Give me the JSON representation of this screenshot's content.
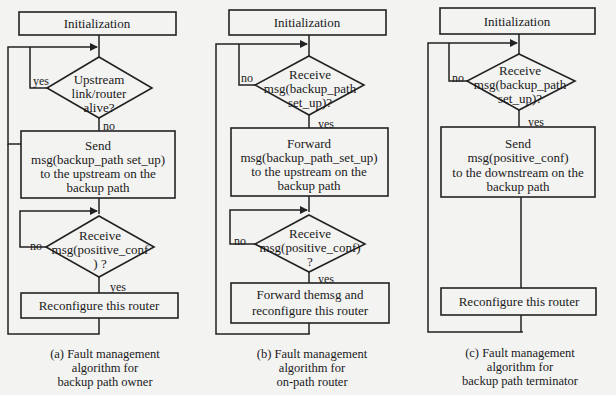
{
  "diagrams": [
    {
      "id": "a",
      "init": "Initialization",
      "decision1": [
        "Upstream",
        "link/router",
        "alive?"
      ],
      "d1_yes": "yes",
      "d1_no": "no",
      "action1": [
        "Send",
        "msg(backup_path set_up)",
        "to the upstream on the",
        "backup path"
      ],
      "decision2": [
        "Receive",
        "msg(positive_conf",
        ") ?"
      ],
      "d2_no": "no",
      "d2_yes": "yes",
      "action2": [
        "Reconfigure this router"
      ],
      "caption": [
        "(a) Fault management",
        "algorithm for",
        "backup path owner"
      ]
    },
    {
      "id": "b",
      "init": "Initialization",
      "decision1": [
        "Receive",
        "msg(backup_path",
        "set_up)?"
      ],
      "d1_no": "no",
      "d1_yes": "yes",
      "action1": [
        "Forward",
        "msg(backup_path_set_up)",
        "to the upstream on the",
        "backup path"
      ],
      "decision2": [
        "Receive",
        "msg(positive_conf)",
        "?"
      ],
      "d2_no": "no",
      "d2_yes": "yes",
      "action2": [
        "Forward themsg and",
        "reconfigure this router"
      ],
      "caption": [
        "(b) Fault management",
        "algorithm for",
        "on-path router"
      ]
    },
    {
      "id": "c",
      "init": "Initialization",
      "decision1": [
        "Receive",
        "msg(backup_path",
        "set_up)?"
      ],
      "d1_no": "no",
      "d1_yes": "yes",
      "action1": [
        "Send",
        "msg(positive_conf)",
        "to the downstream on the",
        "backup path"
      ],
      "action2": [
        "Reconfigure this router"
      ],
      "caption": [
        "(c) Fault management",
        "algorithm for",
        "backup path terminator"
      ]
    }
  ]
}
